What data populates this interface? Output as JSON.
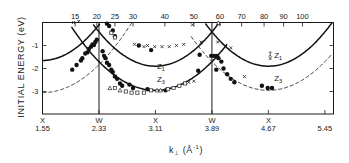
{
  "chart_data": {
    "type": "scatter",
    "title": "",
    "ylabel": "INITIAL ENERGY (eV)",
    "xlabel": "k⊥ (Å⁻¹)",
    "xlabel_parts": {
      "main": "k",
      "sub": "⊥",
      "unit": "(Å",
      "sup": "-1",
      "close": ")"
    },
    "xlim": [
      1.55,
      5.55
    ],
    "ylim": [
      -4,
      0
    ],
    "x_ticks": [
      {
        "value": 1.55,
        "point": "X",
        "label": "1.55"
      },
      {
        "value": 2.33,
        "point": "W",
        "label": "2.33"
      },
      {
        "value": 3.11,
        "point": "X",
        "label": "3.11"
      },
      {
        "value": 3.89,
        "point": "W",
        "label": "3.89"
      },
      {
        "value": 4.67,
        "point": "X",
        "label": "4.67"
      },
      {
        "value": 5.45,
        "point": "",
        "label": "5.45"
      }
    ],
    "vertical_lines_at": [
      2.33,
      3.89
    ],
    "y_ticks": [
      {
        "value": -1,
        "label": "-1"
      },
      {
        "value": -2,
        "label": "-2"
      },
      {
        "value": -3,
        "label": "-3"
      }
    ],
    "top_axis": {
      "label": "photon energy",
      "ticks": [
        {
          "k": 2.0,
          "label": "15"
        },
        {
          "k": 2.3,
          "label": "20"
        },
        {
          "k": 2.55,
          "label": "25"
        },
        {
          "k": 2.8,
          "label": "30"
        },
        {
          "k": 3.24,
          "label": "40"
        },
        {
          "k": 3.64,
          "label": "50"
        },
        {
          "k": 4.0,
          "label": "60"
        },
        {
          "k": 4.3,
          "label": "70"
        },
        {
          "k": 4.61,
          "label": "80"
        },
        {
          "k": 4.88,
          "label": "90"
        },
        {
          "k": 5.14,
          "label": "100"
        }
      ]
    },
    "curves": [
      {
        "name": "Z1",
        "style": "solid",
        "center": 1.55,
        "min": -1.65,
        "k2": 2.55,
        "range": [
          1.55,
          2.34
        ]
      },
      {
        "name": "Z1",
        "style": "solid",
        "center": 3.11,
        "min": -1.9,
        "k2": 2.45,
        "range": [
          2.25,
          3.99
        ]
      },
      {
        "name": "Z1",
        "style": "solid",
        "center": 4.67,
        "min": -1.9,
        "k2": 2.45,
        "range": [
          3.8,
          5.55
        ]
      },
      {
        "name": "Z3",
        "style": "dashed",
        "center": 1.55,
        "min": -3.05,
        "k2": 2.0,
        "range": [
          1.55,
          2.8
        ]
      },
      {
        "name": "Z3",
        "style": "solid",
        "center": 3.11,
        "min": -2.95,
        "k2": 2.05,
        "range": [
          1.95,
          4.1
        ]
      },
      {
        "name": "Z3",
        "style": "dashed",
        "center": 4.67,
        "min": -2.95,
        "k2": 2.05,
        "range": [
          3.6,
          5.55
        ]
      }
    ],
    "curve_labels": [
      {
        "text": "Z",
        "sub": "1",
        "k": 3.13,
        "e": -2.0
      },
      {
        "text": "Z",
        "sub": "3",
        "k": 3.13,
        "e": -2.6
      },
      {
        "text": "Z",
        "sub": "1",
        "k": 4.75,
        "e": -1.55,
        "errorbar": true
      },
      {
        "text": "Z",
        "sub": "3",
        "k": 4.75,
        "e": -2.55
      }
    ],
    "series": [
      {
        "name": "filled circles",
        "marker": "dot",
        "points": [
          [
            1.96,
            -2.05
          ],
          [
            2.02,
            -1.85
          ],
          [
            2.08,
            -1.65
          ],
          [
            2.1,
            -1.55
          ],
          [
            2.14,
            -1.35
          ],
          [
            2.17,
            -1.3
          ],
          [
            2.19,
            -1.15
          ],
          [
            2.22,
            -1.05
          ],
          [
            2.24,
            -0.95
          ],
          [
            2.26,
            -0.98
          ],
          [
            2.28,
            -0.85
          ],
          [
            2.3,
            -0.75
          ],
          [
            2.38,
            -1.25
          ],
          [
            2.4,
            -1.45
          ],
          [
            2.42,
            -1.55
          ],
          [
            2.44,
            -1.75
          ],
          [
            2.47,
            -1.85
          ],
          [
            2.5,
            -2.05
          ],
          [
            2.52,
            -2.15
          ],
          [
            2.55,
            -2.35
          ],
          [
            2.58,
            -2.45
          ],
          [
            2.62,
            -2.65
          ],
          [
            2.65,
            -2.75
          ],
          [
            2.44,
            -0.05
          ],
          [
            2.47,
            -0.15
          ],
          [
            2.52,
            -0.35
          ],
          [
            2.55,
            -0.6
          ],
          [
            2.75,
            -2.7
          ],
          [
            2.8,
            -2.85
          ],
          [
            2.88,
            -1.0
          ],
          [
            3.0,
            -2.9
          ],
          [
            3.05,
            -1.2
          ],
          [
            3.25,
            -2.95
          ],
          [
            3.72,
            -1.4
          ],
          [
            3.88,
            -1.45
          ],
          [
            3.92,
            -1.45
          ],
          [
            3.96,
            -1.45
          ],
          [
            3.98,
            -1.55
          ],
          [
            4.02,
            -1.7
          ],
          [
            3.95,
            -2.05
          ],
          [
            4.05,
            -2.0
          ],
          [
            4.1,
            -2.25
          ],
          [
            4.15,
            -2.45
          ],
          [
            4.2,
            -2.6
          ],
          [
            3.7,
            -2.1
          ],
          [
            4.58,
            -2.75
          ],
          [
            4.66,
            -2.85
          ],
          [
            4.72,
            -2.85
          ]
        ]
      },
      {
        "name": "crosses",
        "marker": "x",
        "points": [
          [
            1.98,
            0.0
          ],
          [
            2.05,
            0.05
          ],
          [
            2.82,
            -0.95
          ],
          [
            2.95,
            -1.05
          ],
          [
            3.0,
            -1.0
          ],
          [
            3.1,
            -1.05
          ],
          [
            3.2,
            -1.05
          ],
          [
            3.3,
            -1.05
          ],
          [
            3.4,
            -1.0
          ],
          [
            3.5,
            -0.95
          ],
          [
            3.62,
            -0.1
          ],
          [
            3.74,
            -0.85
          ],
          [
            3.57,
            -2.6
          ],
          [
            3.64,
            -2.55
          ],
          [
            3.97,
            -0.85
          ],
          [
            4.15,
            -1.1
          ],
          [
            4.34,
            -2.35
          ]
        ]
      },
      {
        "name": "open squares",
        "marker": "square",
        "points": [
          [
            2.55,
            -2.85
          ],
          [
            2.7,
            -3.0
          ],
          [
            2.78,
            -3.05
          ],
          [
            2.86,
            -3.05
          ],
          [
            2.95,
            -3.05
          ],
          [
            3.05,
            -2.95
          ],
          [
            3.28,
            -2.9
          ],
          [
            3.36,
            -2.85
          ],
          [
            3.44,
            -2.75
          ],
          [
            3.52,
            -2.65
          ],
          [
            2.5,
            -0.45
          ],
          [
            2.55,
            -0.65
          ]
        ]
      },
      {
        "name": "open triangles",
        "marker": "triangle",
        "points": [
          [
            2.48,
            -2.85
          ],
          [
            2.62,
            -2.95
          ],
          [
            3.18,
            -2.95
          ],
          [
            3.13,
            -2.95
          ],
          [
            3.98,
            -0.02
          ]
        ]
      }
    ]
  }
}
